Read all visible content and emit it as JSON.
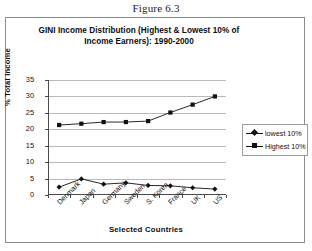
{
  "figure": {
    "caption": "Figure 6.3"
  },
  "chart_data": {
    "type": "line",
    "title": "GINI Income Distribution (Highest & Lowest 10% of Income Earners): 1990-2000",
    "title_line1": "GINI Income Distribution (Highest & Lowest 10% of",
    "title_line2": "Income Earners): 1990-2000",
    "xlabel": "Selected Countries",
    "ylabel": "% Total Income",
    "categories": [
      "Denmark",
      "Japan",
      "Germany",
      "Sweden",
      "S. Korea",
      "France",
      "UK",
      "US"
    ],
    "series": [
      {
        "name": "lowest 10%",
        "marker": "diamond",
        "values": [
          2.4,
          4.9,
          3.3,
          3.7,
          2.9,
          2.8,
          2.2,
          1.8
        ]
      },
      {
        "name": "Highest 10%",
        "marker": "square",
        "values": [
          21.3,
          21.7,
          22.2,
          22.2,
          22.5,
          25.1,
          27.5,
          30.0
        ]
      }
    ],
    "yticks": [
      0,
      5,
      10,
      15,
      20,
      25,
      30,
      35
    ],
    "ylim": [
      0,
      35
    ],
    "grid": true,
    "legend_position": "right",
    "line_color": "#111111",
    "grid_color": "#b9b9b9"
  }
}
